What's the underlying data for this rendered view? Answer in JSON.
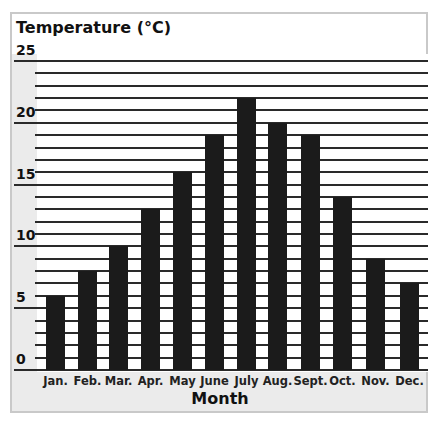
{
  "chart_data": {
    "type": "bar",
    "title": "",
    "ylabel": "Temperature (°C)",
    "xlabel": "Month",
    "categories": [
      "Jan.",
      "Feb.",
      "Mar.",
      "Apr.",
      "May",
      "June",
      "July",
      "Aug.",
      "Sept.",
      "Oct.",
      "Nov.",
      "Dec."
    ],
    "values": [
      6,
      8,
      10,
      13,
      16,
      19,
      22,
      20,
      19,
      14,
      9,
      7
    ],
    "ylim": [
      0,
      25
    ],
    "yticks": [
      0,
      5,
      10,
      15,
      20,
      25
    ],
    "grid": true,
    "grid_step": 1,
    "bar_color": "#1b1b1b",
    "legend": null
  },
  "labels": {
    "y_title": "Temperature (°C)",
    "x_title": "Month",
    "yticks": [
      "0",
      "5",
      "10",
      "15",
      "20",
      "25"
    ],
    "months": [
      "Jan.",
      "Feb.",
      "Mar.",
      "Apr.",
      "May",
      "June",
      "July",
      "Aug.",
      "Sept.",
      "Oct.",
      "Nov.",
      "Dec."
    ]
  }
}
